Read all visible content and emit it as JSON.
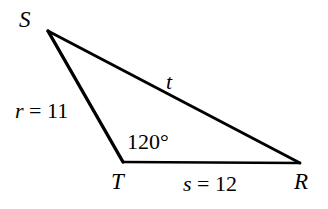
{
  "figure": {
    "kind": "geometry-diagram",
    "shape": "triangle",
    "background_color": "#ffffff",
    "stroke_color": "#000000",
    "width": 328,
    "height": 209
  },
  "vertices": [
    {
      "name": "S",
      "label": "S",
      "x": 48,
      "y": 31
    },
    {
      "name": "T",
      "label": "T",
      "x": 123,
      "y": 162
    },
    {
      "name": "R",
      "label": "R",
      "x": 300,
      "y": 163
    }
  ],
  "sides": [
    {
      "name": "side-r",
      "between": "S-T",
      "variable": "r",
      "equals": "=",
      "value": "11",
      "text": "r = 11"
    },
    {
      "name": "side-s",
      "between": "T-R",
      "variable": "s",
      "equals": "=",
      "value": "12",
      "text": "s = 12"
    },
    {
      "name": "side-t",
      "between": "S-R",
      "variable": "t",
      "equals": "",
      "value": "",
      "text": "t"
    }
  ],
  "angles": [
    {
      "name": "angle-T",
      "at_vertex": "T",
      "text": "120°",
      "value": "120",
      "unit": "°"
    }
  ],
  "labels": {
    "vertex_S": "S",
    "vertex_T": "T",
    "vertex_R": "R",
    "side_r_var": "r",
    "side_r_eq": " = ",
    "side_r_val": "11",
    "side_s_var": "s",
    "side_s_eq": " = ",
    "side_s_val": "12",
    "side_t_var": "t",
    "angle_T": "120°"
  }
}
